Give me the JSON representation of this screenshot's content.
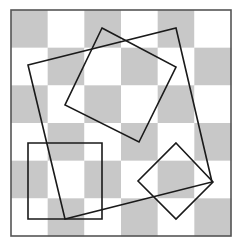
{
  "diagram": {
    "board": {
      "x": 11,
      "y": 10,
      "width": 220,
      "height": 226,
      "rows": 6,
      "cols": 6,
      "dark_color": "#c8c8c8",
      "light_color": "#ffffff",
      "border_color": "#555555",
      "top_left_dark": true
    },
    "shapes": [
      {
        "id": "large-tilted-square",
        "points": [
          [
            28,
            65
          ],
          [
            176,
            28
          ],
          [
            212,
            182
          ],
          [
            65,
            219
          ]
        ],
        "stroke": "#1a1a1a"
      },
      {
        "id": "medium-tilted-square",
        "points": [
          [
            102,
            28
          ],
          [
            176,
            67
          ],
          [
            139,
            142
          ],
          [
            65,
            105
          ]
        ],
        "stroke": "#1a1a1a"
      },
      {
        "id": "small-axis-square",
        "points": [
          [
            28,
            143
          ],
          [
            102,
            143
          ],
          [
            102,
            219
          ],
          [
            28,
            219
          ]
        ],
        "stroke": "#1a1a1a"
      },
      {
        "id": "small-diamond",
        "points": [
          [
            176,
            143
          ],
          [
            213,
            182
          ],
          [
            176,
            219
          ],
          [
            138,
            181
          ]
        ],
        "stroke": "#1a1a1a"
      }
    ]
  }
}
